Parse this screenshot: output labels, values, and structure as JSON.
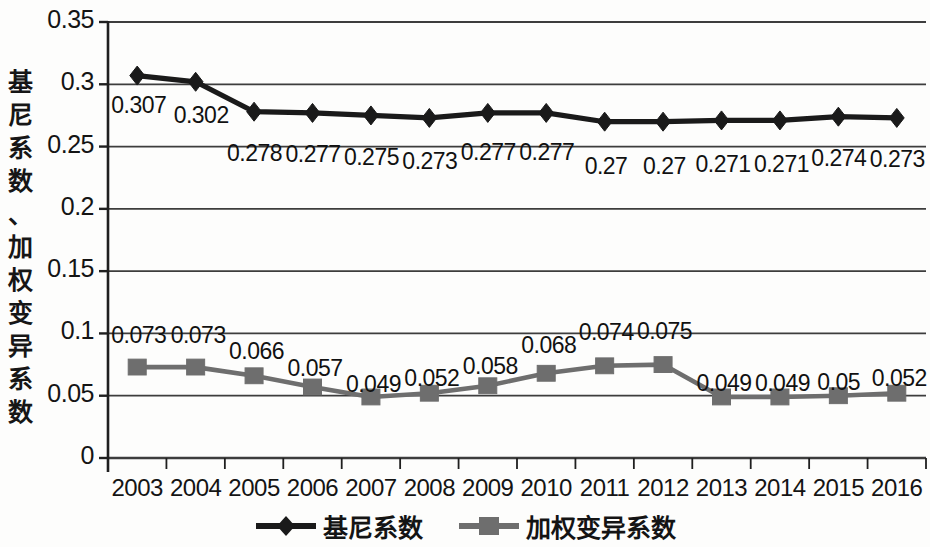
{
  "chart_data": {
    "type": "line",
    "title": "",
    "xlabel": "",
    "ylabel": "基尼系数、加权变异系数",
    "categories": [
      "2003",
      "2004",
      "2005",
      "2006",
      "2007",
      "2008",
      "2009",
      "2010",
      "2011",
      "2012",
      "2013",
      "2014",
      "2015",
      "2016"
    ],
    "ylim": [
      0,
      0.35
    ],
    "yticks": [
      "0",
      "0.05",
      "0.1",
      "0.15",
      "0.2",
      "0.25",
      "0.3",
      "0.35"
    ],
    "ytick_values": [
      0,
      0.05,
      0.1,
      0.15,
      0.2,
      0.25,
      0.3,
      0.35
    ],
    "grid": true,
    "legend_position": "bottom",
    "series": [
      {
        "name": "基尼系数",
        "marker": "diamond",
        "color": "#1a1a1a",
        "values": [
          0.307,
          0.302,
          0.278,
          0.277,
          0.275,
          0.273,
          0.277,
          0.277,
          0.27,
          0.27,
          0.271,
          0.271,
          0.274,
          0.273
        ],
        "labels": [
          "0.307",
          "0.302",
          "0.278",
          "0.277",
          "0.275",
          "0.273",
          "0.277",
          "0.277",
          "0.27",
          "0.27",
          "0.271",
          "0.271",
          "0.274",
          "0.273"
        ]
      },
      {
        "name": "加权变异系数",
        "marker": "square",
        "color": "#6e6e6e",
        "values": [
          0.073,
          0.073,
          0.066,
          0.057,
          0.049,
          0.052,
          0.058,
          0.068,
          0.074,
          0.075,
          0.049,
          0.049,
          0.05,
          0.052
        ],
        "labels": [
          "0.073",
          "0.073",
          "0.066",
          "0.057",
          "0.049",
          "0.052",
          "0.058",
          "0.068",
          "0.074",
          "0.075",
          "0.049",
          "0.049",
          "0.05",
          "0.052"
        ]
      }
    ]
  },
  "legend": {
    "items": [
      {
        "label": "基尼系数",
        "color": "#1a1a1a",
        "marker": "diamond"
      },
      {
        "label": "加权变异系数",
        "color": "#6e6e6e",
        "marker": "square"
      }
    ]
  },
  "axis_title": {
    "text": "基尼系数、加权变异系数",
    "chars": [
      "基",
      "尼",
      "系",
      "数",
      "、",
      "加",
      "权",
      "变",
      "异",
      "系",
      "数"
    ]
  },
  "colors": {
    "series1": "#1a1a1a",
    "series2": "#6e6e6e",
    "grid": "#3d3d3d",
    "axis": "#1f1f1f",
    "background": "#fdfdfc",
    "text": "#141414"
  }
}
